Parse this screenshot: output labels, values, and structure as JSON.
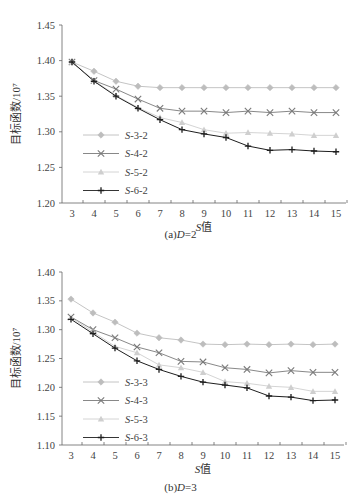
{
  "chart_data": [
    {
      "type": "line",
      "title": "",
      "caption": "(a)D=2",
      "caption_prefix": "(a)",
      "caption_var": "D",
      "caption_value": "=2",
      "xlabel": "S值",
      "xlabel_var": "S",
      "xlabel_suffix": "值",
      "ylabel": "目标函数/10⁷",
      "ylim": [
        1.2,
        1.45
      ],
      "yticks": [
        "1.20",
        "1.25",
        "1.30",
        "1.35",
        "1.40",
        "1.45"
      ],
      "x": [
        3,
        4,
        5,
        6,
        7,
        8,
        9,
        10,
        11,
        12,
        13,
        14,
        15
      ],
      "grid": false,
      "legend_position": "lower left",
      "series": [
        {
          "name": "S-3-2",
          "marker": "diamond",
          "color": "#bdbdbd",
          "values": [
            1.398,
            1.385,
            1.371,
            1.364,
            1.362,
            1.362,
            1.362,
            1.362,
            1.362,
            1.362,
            1.362,
            1.362,
            1.362
          ]
        },
        {
          "name": "S-4-2",
          "marker": "x",
          "color": "#7a7a7a",
          "values": [
            1.398,
            1.372,
            1.36,
            1.346,
            1.333,
            1.329,
            1.329,
            1.327,
            1.329,
            1.327,
            1.329,
            1.327,
            1.327
          ]
        },
        {
          "name": "S-5-2",
          "marker": "triangle",
          "color": "#cfcfcf",
          "values": [
            1.398,
            1.372,
            1.351,
            1.334,
            1.32,
            1.313,
            1.303,
            1.298,
            1.299,
            1.298,
            1.297,
            1.295,
            1.295
          ]
        },
        {
          "name": "S-6-2",
          "marker": "plus",
          "color": "#1e1e1e",
          "values": [
            1.398,
            1.371,
            1.35,
            1.333,
            1.317,
            1.303,
            1.297,
            1.292,
            1.28,
            1.274,
            1.275,
            1.273,
            1.272
          ]
        }
      ]
    },
    {
      "type": "line",
      "title": "",
      "caption": "(b)D=3",
      "caption_prefix": "(b)",
      "caption_var": "D",
      "caption_value": "=3",
      "xlabel": "S值",
      "xlabel_var": "S",
      "xlabel_suffix": "值",
      "ylabel": "目标函数/10⁷",
      "ylim": [
        1.1,
        1.4
      ],
      "yticks": [
        "1.10",
        "1.15",
        "1.20",
        "1.25",
        "1.30",
        "1.35",
        "1.40"
      ],
      "x": [
        3,
        4,
        5,
        6,
        7,
        8,
        9,
        10,
        11,
        12,
        13,
        14,
        15
      ],
      "grid": false,
      "legend_position": "lower left",
      "series": [
        {
          "name": "S-3-3",
          "marker": "diamond",
          "color": "#bdbdbd",
          "values": [
            1.353,
            1.329,
            1.313,
            1.294,
            1.286,
            1.282,
            1.275,
            1.274,
            1.275,
            1.274,
            1.275,
            1.274,
            1.275
          ]
        },
        {
          "name": "S-4-3",
          "marker": "x",
          "color": "#7a7a7a",
          "values": [
            1.322,
            1.3,
            1.286,
            1.27,
            1.26,
            1.245,
            1.244,
            1.234,
            1.231,
            1.225,
            1.229,
            1.226,
            1.226
          ]
        },
        {
          "name": "S-5-3",
          "marker": "triangle",
          "color": "#cfcfcf",
          "values": [
            1.321,
            1.296,
            1.271,
            1.26,
            1.239,
            1.234,
            1.226,
            1.21,
            1.207,
            1.202,
            1.2,
            1.193,
            1.193
          ]
        },
        {
          "name": "S-6-3",
          "marker": "plus",
          "color": "#1e1e1e",
          "values": [
            1.318,
            1.293,
            1.268,
            1.246,
            1.231,
            1.219,
            1.209,
            1.204,
            1.199,
            1.185,
            1.183,
            1.177,
            1.178
          ]
        }
      ]
    }
  ]
}
